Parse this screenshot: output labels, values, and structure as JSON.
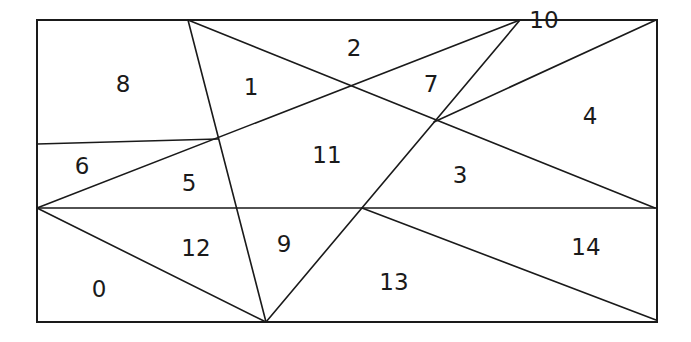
{
  "diagram": {
    "type": "partitioned-rectangle",
    "colors": {
      "line": "#1a1a1a",
      "background": "#ffffff"
    },
    "rect": {
      "x": 37,
      "y": 20,
      "width": 620,
      "height": 302
    },
    "edges": [
      {
        "id": "e1",
        "x1": 188,
        "y1": 20,
        "x2": 266,
        "y2": 322
      },
      {
        "id": "e2",
        "x1": 188,
        "y1": 20,
        "x2": 655,
        "y2": 208
      },
      {
        "id": "e3",
        "x1": 37,
        "y1": 208,
        "x2": 520,
        "y2": 20
      },
      {
        "id": "e4",
        "x1": 37,
        "y1": 144,
        "x2": 218,
        "y2": 139
      },
      {
        "id": "e5",
        "x1": 434,
        "y1": 122,
        "x2": 656,
        "y2": 20
      },
      {
        "id": "e6",
        "x1": 520,
        "y1": 20,
        "x2": 266,
        "y2": 322
      },
      {
        "id": "e7",
        "x1": 37,
        "y1": 208,
        "x2": 656,
        "y2": 208
      },
      {
        "id": "e8",
        "x1": 37,
        "y1": 208,
        "x2": 266,
        "y2": 322
      },
      {
        "id": "e9",
        "x1": 362,
        "y1": 208,
        "x2": 656,
        "y2": 320
      }
    ],
    "regions": [
      {
        "label": "0",
        "x": 99,
        "y": 289
      },
      {
        "label": "1",
        "x": 251,
        "y": 87
      },
      {
        "label": "2",
        "x": 354,
        "y": 48
      },
      {
        "label": "3",
        "x": 460,
        "y": 175
      },
      {
        "label": "4",
        "x": 590,
        "y": 116
      },
      {
        "label": "5",
        "x": 189,
        "y": 183
      },
      {
        "label": "6",
        "x": 82,
        "y": 166
      },
      {
        "label": "7",
        "x": 431,
        "y": 84
      },
      {
        "label": "8",
        "x": 123,
        "y": 84
      },
      {
        "label": "9",
        "x": 284,
        "y": 244
      },
      {
        "label": "10",
        "x": 544,
        "y": 20
      },
      {
        "label": "11",
        "x": 327,
        "y": 155
      },
      {
        "label": "12",
        "x": 196,
        "y": 248
      },
      {
        "label": "13",
        "x": 394,
        "y": 282
      },
      {
        "label": "14",
        "x": 586,
        "y": 247
      }
    ]
  }
}
